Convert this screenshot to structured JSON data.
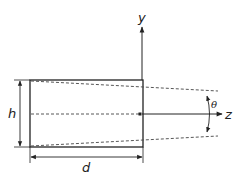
{
  "diagram": {
    "labels": {
      "y_axis": "y",
      "z_axis": "z",
      "height": "h",
      "depth": "d",
      "angle": "θ"
    },
    "colors": {
      "line": "#222222",
      "dashed": "#444444",
      "background": "#ffffff"
    }
  }
}
